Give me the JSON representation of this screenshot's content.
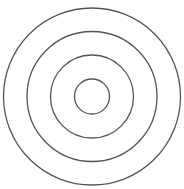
{
  "diagram": {
    "type": "concentric-circles",
    "center": {
      "x": 92,
      "y": 96.5
    },
    "stroke_color": "#555555",
    "stroke_width": 1.3,
    "fill": "none",
    "background": "#ffffff",
    "rings": [
      {
        "name": "ring-outer",
        "r": 88.5
      },
      {
        "name": "ring-3",
        "r": 65
      },
      {
        "name": "ring-2",
        "r": 41.5
      },
      {
        "name": "ring-inner",
        "r": 17.5
      }
    ]
  }
}
